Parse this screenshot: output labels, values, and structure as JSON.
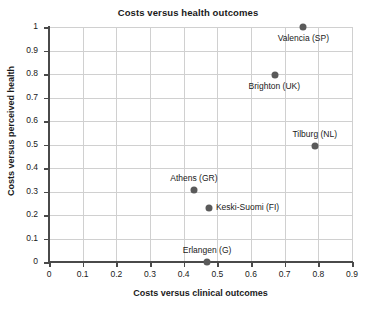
{
  "chart_data": {
    "type": "scatter",
    "title": "Costs versus health outcomes",
    "xlabel": "Costs versus clinical outcomes",
    "ylabel": "Costs versus perceived health",
    "xlim": [
      0,
      0.9
    ],
    "ylim": [
      0,
      1
    ],
    "grid": true,
    "legend": "none",
    "xticks": [
      "0",
      "0.1",
      "0.2",
      "0.3",
      "0.4",
      "0.5",
      "0.6",
      "0.7",
      "0.8",
      "0.9"
    ],
    "xtick_values": [
      0,
      0.1,
      0.2,
      0.3,
      0.4,
      0.5,
      0.6,
      0.7,
      0.8,
      0.9
    ],
    "yticks": [
      "0",
      "0.1",
      "0.2",
      "0.3",
      "0.4",
      "0.5",
      "0.6",
      "0.7",
      "0.8",
      "0.9",
      "1"
    ],
    "ytick_values": [
      0,
      0.1,
      0.2,
      0.3,
      0.4,
      0.5,
      0.6,
      0.7,
      0.8,
      0.9,
      1
    ],
    "marker_color": "#5a5a5a",
    "grid_color": "#d0d0d0",
    "axis_color": "#4a4a4a",
    "points": [
      {
        "label": "Valencia (SP)",
        "x": 0.755,
        "y": 1.0,
        "label_pos": "below"
      },
      {
        "label": "Brighton (UK)",
        "x": 0.67,
        "y": 0.795,
        "label_pos": "below"
      },
      {
        "label": "Tilburg (NL)",
        "x": 0.79,
        "y": 0.495,
        "label_pos": "above"
      },
      {
        "label": "Athens (GR)",
        "x": 0.43,
        "y": 0.305,
        "label_pos": "above"
      },
      {
        "label": "Keski-Suomi (FI)",
        "x": 0.475,
        "y": 0.23,
        "label_pos": "right"
      },
      {
        "label": "Erlangen (G)",
        "x": 0.47,
        "y": 0.0,
        "label_pos": "above"
      }
    ]
  }
}
